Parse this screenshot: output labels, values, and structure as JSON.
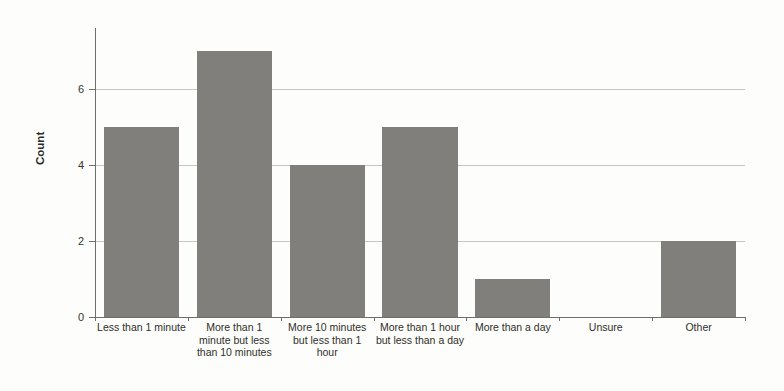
{
  "chart_data": {
    "type": "bar",
    "title": "",
    "xlabel": "",
    "ylabel": "Count",
    "ylim": [
      0,
      7.6
    ],
    "yticks": [
      0,
      2,
      4,
      6
    ],
    "grid": true,
    "legend": "none",
    "bar_color": "#807f7c",
    "background_color": "#fdfdfb",
    "categories": [
      "Less than 1 minute",
      "More than 1 minute but less than 10 minutes",
      "More 10 minutes but less than 1 hour",
      "More than 1 hour but less than a day",
      "More than a day",
      "Unsure",
      "Other"
    ],
    "values": [
      5,
      7,
      4,
      5,
      1,
      0,
      2
    ]
  },
  "axis": {
    "y_title": "Count",
    "y_tick_labels": [
      "0",
      "2",
      "4",
      "6"
    ]
  },
  "x_tick_labels": [
    "Less than 1 minute",
    "More than 1 minute but less than 10 minutes",
    "More 10 minutes but less than 1 hour",
    "More than 1 hour but less than a day",
    "More than a day",
    "Unsure",
    "Other"
  ]
}
